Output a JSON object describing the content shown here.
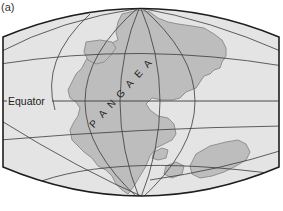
{
  "figure": {
    "panel_label": "(a)",
    "labels": {
      "equator": "Equator",
      "supercontinent": "PANGAEA"
    },
    "colors": {
      "ocean": "#e4e4e4",
      "land": "#bdbdbd",
      "land_outline": "#8f8f8f",
      "grid": "#3a3a3a",
      "border": "#1e1e1e",
      "text": "#222222"
    }
  }
}
